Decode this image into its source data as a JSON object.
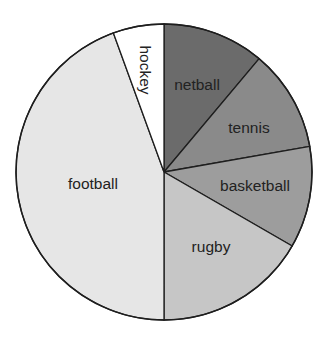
{
  "chart_data": {
    "type": "pie",
    "title": "",
    "start_angle_deg": 0,
    "direction": "clockwise",
    "categories": [
      "netball",
      "tennis",
      "basketball",
      "rugby",
      "football",
      "hockey"
    ],
    "values": [
      40,
      40,
      40,
      60,
      160,
      20
    ],
    "units": "degrees",
    "colors": [
      "#6b6b6b",
      "#8a8a8a",
      "#9d9d9d",
      "#c6c6c6",
      "#e6e6e6",
      "#ffffff"
    ],
    "labels_inside": true,
    "label_rotation_deg": [
      0,
      0,
      0,
      0,
      0,
      90
    ],
    "legend": "none"
  },
  "geometry": {
    "cx": 164,
    "cy": 172,
    "r": 148
  },
  "label_positions": [
    {
      "x": 197,
      "y": 84
    },
    {
      "x": 249,
      "y": 127
    },
    {
      "x": 255,
      "y": 185
    },
    {
      "x": 211,
      "y": 246
    },
    {
      "x": 93,
      "y": 183
    },
    {
      "x": 145,
      "y": 70
    }
  ]
}
